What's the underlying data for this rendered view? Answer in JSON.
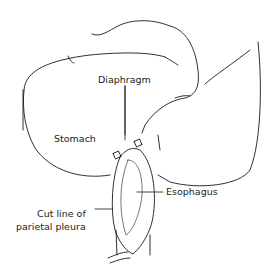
{
  "diagram": {
    "labels": {
      "diaphragm": "Diaphragm",
      "stomach": "Stomach",
      "esophagus": "Esophagus",
      "cut_line_1": "Cut line of",
      "cut_line_2": "parietal pleura"
    },
    "colors": {
      "line": "#1a1a1a",
      "background": "#ffffff"
    }
  }
}
